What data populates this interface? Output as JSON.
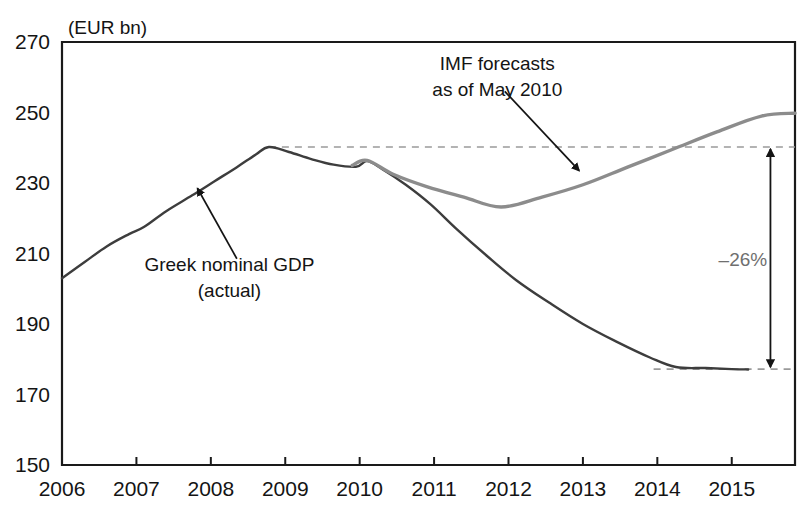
{
  "chart_data": {
    "type": "line",
    "title": "",
    "unit_label": "(EUR bn)",
    "xlabel": "",
    "ylabel": "",
    "xlim": [
      2006,
      2015.85
    ],
    "ylim": [
      150,
      270
    ],
    "ytick_labels": [
      "270",
      "250",
      "230",
      "210",
      "190",
      "170",
      "150"
    ],
    "ytick_values": [
      270,
      250,
      230,
      210,
      190,
      170,
      150
    ],
    "xtick_labels": [
      "2006",
      "2007",
      "2008",
      "2009",
      "2010",
      "2011",
      "2012",
      "2013",
      "2014",
      "2015"
    ],
    "xtick_values": [
      2006,
      2007,
      2008,
      2009,
      2010,
      2011,
      2012,
      2013,
      2014,
      2015
    ],
    "grid": false,
    "legend_position": "none",
    "series": [
      {
        "name": "Greek nominal GDP (actual)",
        "color": "#3d3d3d",
        "style": "solid",
        "width": 2.4,
        "points": [
          [
            2006.0,
            203.0
          ],
          [
            2006.3,
            207.5
          ],
          [
            2006.6,
            212.0
          ],
          [
            2006.9,
            215.5
          ],
          [
            2007.1,
            217.5
          ],
          [
            2007.4,
            222.0
          ],
          [
            2007.75,
            226.5
          ],
          [
            2008.05,
            230.5
          ],
          [
            2008.35,
            234.5
          ],
          [
            2008.6,
            238.0
          ],
          [
            2008.78,
            240.2
          ],
          [
            2009.05,
            238.8
          ],
          [
            2009.35,
            236.8
          ],
          [
            2009.65,
            235.2
          ],
          [
            2009.95,
            234.6
          ],
          [
            2010.1,
            236.2
          ],
          [
            2010.3,
            234.0
          ],
          [
            2010.62,
            229.5
          ],
          [
            2010.95,
            224.0
          ],
          [
            2011.3,
            217.0
          ],
          [
            2011.7,
            209.5
          ],
          [
            2012.1,
            202.5
          ],
          [
            2012.55,
            196.0
          ],
          [
            2013.0,
            190.0
          ],
          [
            2013.45,
            185.0
          ],
          [
            2013.9,
            180.5
          ],
          [
            2014.25,
            177.8
          ],
          [
            2014.65,
            177.5
          ],
          [
            2015.0,
            177.2
          ],
          [
            2015.22,
            177.1
          ]
        ]
      },
      {
        "name": "IMF forecasts as of May 2010",
        "color": "#8c8c8c",
        "style": "solid",
        "width": 3.4,
        "points": [
          [
            2009.9,
            235.0
          ],
          [
            2010.1,
            236.4
          ],
          [
            2010.45,
            232.5
          ],
          [
            2010.9,
            229.0
          ],
          [
            2011.4,
            226.0
          ],
          [
            2011.9,
            223.2
          ],
          [
            2012.45,
            226.0
          ],
          [
            2013.0,
            229.5
          ],
          [
            2013.6,
            234.5
          ],
          [
            2014.2,
            239.5
          ],
          [
            2014.8,
            244.5
          ],
          [
            2015.4,
            249.0
          ],
          [
            2015.85,
            249.8
          ]
        ]
      }
    ],
    "reference_lines": [
      {
        "name": "peak-dashed-line",
        "value": 240.2,
        "from_x": 2008.78,
        "to_x": 2015.85,
        "style": "dashed",
        "color": "#9a9a9a"
      },
      {
        "name": "trough-dashed-line",
        "value": 177.2,
        "from_x": 2013.95,
        "to_x": 2015.85,
        "style": "dashed",
        "color": "#9a9a9a"
      }
    ],
    "annotations": [
      {
        "name": "imf-forecast-annotation",
        "text_lines": [
          "IMF forecasts",
          "as of May 2010"
        ],
        "text_x": 2011.85,
        "text_y": 262.0,
        "arrow_from": [
          2011.95,
          256.0
        ],
        "arrow_to": [
          2012.95,
          233.5
        ],
        "color": "#141414"
      },
      {
        "name": "greek-gdp-annotation",
        "text_lines": [
          "Greek nominal GDP",
          "(actual)"
        ],
        "text_x": 2008.25,
        "text_y": 205.0,
        "arrow_from": [
          2008.35,
          208.5
        ],
        "arrow_to": [
          2007.82,
          228.5
        ],
        "color": "#141414"
      },
      {
        "name": "gap-percent-annotation",
        "text": "–26%",
        "text_x": 2015.15,
        "text_y": 208.5,
        "color": "#6f6f6f",
        "arrow_x": 2015.52,
        "arrow_top": 240.2,
        "arrow_bottom": 177.2
      }
    ]
  }
}
